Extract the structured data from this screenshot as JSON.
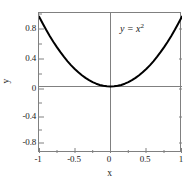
{
  "chart_data": {
    "type": "line",
    "title": "",
    "xlabel": "x",
    "ylabel": "y",
    "annotation": "y = x",
    "annotation_exponent": "2",
    "annotation_equals": "=",
    "annotation_var_y": "y",
    "annotation_var_x": "x",
    "xlim": [
      -1,
      1
    ],
    "ylim": [
      -0.95,
      1.05
    ],
    "xticks": [
      -1,
      -0.5,
      0,
      0.5,
      1
    ],
    "xtick_labels": [
      "-1",
      "-0.5",
      "0",
      "0.5",
      "1"
    ],
    "yticks": [
      0.8,
      0.4,
      0,
      -0.4,
      -0.8
    ],
    "ytick_labels": [
      "0.8",
      "0.4",
      "0",
      "-0.4",
      "-0.8"
    ],
    "minor_xticks": [
      -0.75,
      -0.25,
      0.25,
      0.75
    ],
    "minor_yticks": [
      1.0,
      0.6,
      0.2,
      -0.2,
      -0.6
    ],
    "grid": false,
    "legend": false,
    "zero_lines": {
      "x": 0,
      "y": 0
    },
    "series": [
      {
        "name": "y = x^2",
        "color": "#000000",
        "linewidth": 2,
        "x": [
          -1.0,
          -0.95,
          -0.9,
          -0.85,
          -0.8,
          -0.75,
          -0.7,
          -0.65,
          -0.6,
          -0.55,
          -0.5,
          -0.45,
          -0.4,
          -0.35,
          -0.3,
          -0.25,
          -0.2,
          -0.15,
          -0.1,
          -0.05,
          0.0,
          0.05,
          0.1,
          0.15,
          0.2,
          0.25,
          0.3,
          0.35,
          0.4,
          0.45,
          0.5,
          0.55,
          0.6,
          0.65,
          0.7,
          0.75,
          0.8,
          0.85,
          0.9,
          0.95,
          1.0
        ],
        "y": [
          1.0,
          0.9025,
          0.81,
          0.7225,
          0.64,
          0.5625,
          0.49,
          0.4225,
          0.36,
          0.3025,
          0.25,
          0.2025,
          0.16,
          0.1225,
          0.09,
          0.0625,
          0.04,
          0.0225,
          0.01,
          0.0025,
          0.0,
          0.0025,
          0.01,
          0.0225,
          0.04,
          0.0625,
          0.09,
          0.1225,
          0.16,
          0.2025,
          0.25,
          0.3025,
          0.36,
          0.4225,
          0.49,
          0.5625,
          0.64,
          0.7225,
          0.81,
          0.9025,
          1.0
        ]
      }
    ]
  },
  "colors": {
    "axis": "#808080",
    "frame": "#808080",
    "curve": "#000000",
    "text": "#1a1a1a",
    "background": "#ffffff"
  }
}
